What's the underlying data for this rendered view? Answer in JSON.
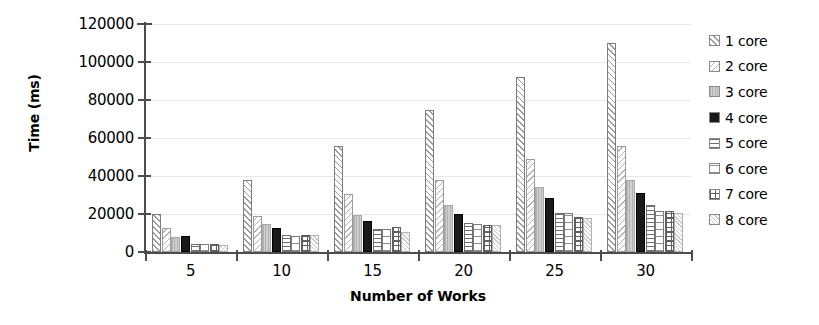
{
  "chart_data": {
    "type": "bar",
    "title": "",
    "xlabel": "Number of Works",
    "ylabel": "Time (ms)",
    "categories": [
      "5",
      "10",
      "15",
      "20",
      "25",
      "30"
    ],
    "ylim": [
      0,
      120000
    ],
    "yticks": [
      0,
      20000,
      40000,
      60000,
      80000,
      100000,
      120000
    ],
    "ytick_labels": [
      "0",
      "20000",
      "40000",
      "60000",
      "80000",
      "100000",
      "120000"
    ],
    "grid": true,
    "legend_position": "right",
    "series": [
      {
        "name": "1 core",
        "pattern": "diagonal-hatch-forward",
        "values": [
          20000,
          38000,
          56000,
          74500,
          92000,
          110000
        ]
      },
      {
        "name": "2 core",
        "pattern": "diagonal-hatch-back",
        "values": [
          12800,
          19000,
          30500,
          38000,
          49000,
          56000
        ]
      },
      {
        "name": "3 core",
        "pattern": "light-grey-fill",
        "values": [
          8000,
          14500,
          19500,
          25000,
          34000,
          38000
        ]
      },
      {
        "name": "4 core",
        "pattern": "solid-black",
        "values": [
          8500,
          12500,
          16500,
          20000,
          28500,
          31000
        ]
      },
      {
        "name": "5 core",
        "pattern": "horizontal-lines",
        "values": [
          4200,
          8800,
          12000,
          15500,
          20500,
          24500
        ]
      },
      {
        "name": "6 core",
        "pattern": "open-grid",
        "values": [
          4000,
          8500,
          12000,
          15000,
          20500,
          21500
        ]
      },
      {
        "name": "7 core",
        "pattern": "checker-dots",
        "values": [
          4000,
          8800,
          13000,
          14000,
          18500,
          21500
        ]
      },
      {
        "name": "8 core",
        "pattern": "light-speckle",
        "values": [
          3800,
          9000,
          10500,
          14000,
          18000,
          20500
        ]
      }
    ]
  },
  "legend": {
    "items": [
      {
        "label": "1 core"
      },
      {
        "label": "2 core"
      },
      {
        "label": "3 core"
      },
      {
        "label": "4 core"
      },
      {
        "label": "5 core"
      },
      {
        "label": "6 core"
      },
      {
        "label": "7 core"
      },
      {
        "label": "8 core"
      }
    ]
  }
}
